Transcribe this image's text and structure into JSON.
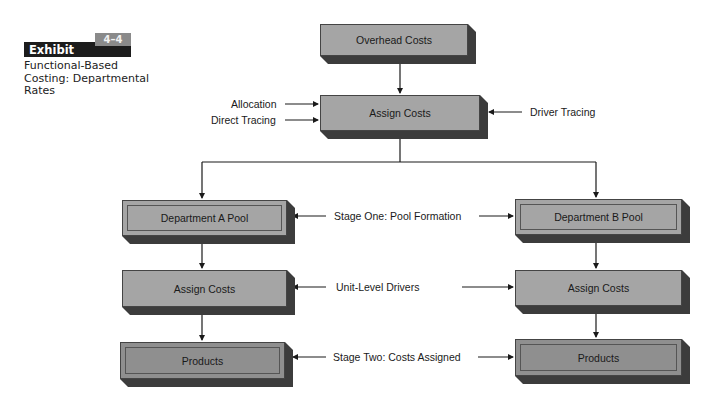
{
  "exhibit": {
    "label": "Exhibit",
    "number": "4–4",
    "caption": "Functional-Based Costing: Departmental Rates"
  },
  "nodes": {
    "overhead": "Overhead Costs",
    "assign_top": "Assign Costs",
    "dept_a_pool": "Department A Pool",
    "dept_b_pool": "Department B Pool",
    "assign_a": "Assign Costs",
    "assign_b": "Assign Costs",
    "products_a": "Products",
    "products_b": "Products"
  },
  "labels": {
    "allocation": "Allocation",
    "direct_tracing": "Direct Tracing",
    "driver_tracing": "Driver Tracing",
    "stage_one": "Stage One:  Pool Formation",
    "unit_level": "Unit-Level Drivers",
    "stage_two": "Stage Two:  Costs Assigned"
  },
  "colors": {
    "box_fill": "#a5a5a5",
    "box_fill_dark": "#8f8f8f",
    "box_shadow": "#3c3c3c",
    "exhibit_bar": "#1c1c1c",
    "exhibit_tab": "#8a8a8a"
  }
}
